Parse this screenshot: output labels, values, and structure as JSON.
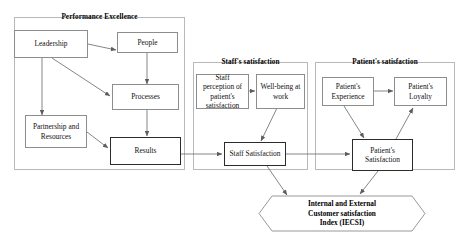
{
  "diagram": {
    "title_hidden": "Model linking Performance Excellence to Staff and Patient satisfaction",
    "panels": [
      {
        "id": "performance",
        "title": "Performance Excellence"
      },
      {
        "id": "staff",
        "title": "Staff's satisfaction"
      },
      {
        "id": "patient",
        "title": "Patient's satisfaction"
      }
    ],
    "nodes": [
      {
        "id": "leadership",
        "label": "Leadership"
      },
      {
        "id": "people",
        "label": "People"
      },
      {
        "id": "processes",
        "label": "Processes"
      },
      {
        "id": "partnership",
        "label": "Partnership and Resources"
      },
      {
        "id": "results",
        "label": "Results"
      },
      {
        "id": "staff-perception",
        "label": "Staff perception of patient's satisfaction"
      },
      {
        "id": "wellbeing",
        "label": "Well-being at work"
      },
      {
        "id": "staff-satisfaction",
        "label": "Staff Satisfaction"
      },
      {
        "id": "patient-experience",
        "label": "Patient's Experience"
      },
      {
        "id": "patient-loyalty",
        "label": "Patient's Loyalty"
      },
      {
        "id": "patient-satisfaction",
        "label": "Patient's Satisfaction"
      }
    ],
    "outcome": {
      "id": "iecsi",
      "line1": "Internal and External",
      "line2": "Customer satisfaction",
      "line3": "Index (IECSI)"
    },
    "connections": [
      {
        "from": "leadership",
        "to": "people"
      },
      {
        "from": "leadership",
        "to": "partnership"
      },
      {
        "from": "leadership",
        "to": "processes"
      },
      {
        "from": "people",
        "to": "processes"
      },
      {
        "from": "processes",
        "to": "results"
      },
      {
        "from": "partnership",
        "to": "results"
      },
      {
        "from": "results",
        "to": "staff-satisfaction"
      },
      {
        "from": "staff-perception",
        "to": "wellbeing"
      },
      {
        "from": "wellbeing",
        "to": "staff-satisfaction"
      },
      {
        "from": "staff-satisfaction",
        "to": "patient-satisfaction"
      },
      {
        "from": "staff-satisfaction",
        "to": "iecsi"
      },
      {
        "from": "patient-experience",
        "to": "patient-loyalty"
      },
      {
        "from": "patient-experience",
        "to": "patient-satisfaction"
      },
      {
        "from": "patient-satisfaction",
        "to": "patient-loyalty"
      },
      {
        "from": "patient-satisfaction",
        "to": "iecsi"
      }
    ],
    "colors": {
      "panel_border": "#b9b9b9",
      "node_border": "#8d8d8d",
      "node_border_strong": "#2b2b2b",
      "arrow": "#6f6f6f",
      "text": "#111111",
      "background": "#ffffff"
    }
  }
}
